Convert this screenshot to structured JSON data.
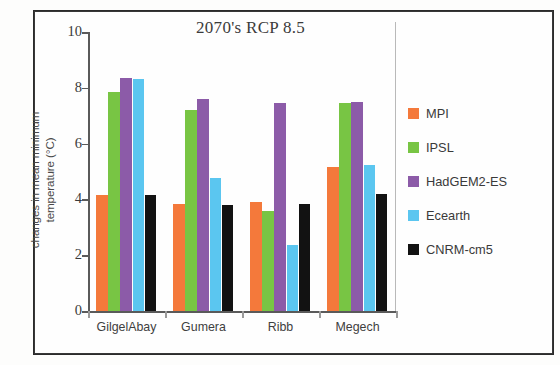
{
  "chart_data": {
    "type": "bar",
    "title": "2070's RCP 8.5",
    "xlabel": "",
    "ylabel": "changes in mean minimum temperature (°C)",
    "ylabel_lines": [
      "changes in mean minimum",
      "temperature (°C)"
    ],
    "ylim": [
      0,
      10
    ],
    "yticks": [
      0,
      2,
      4,
      6,
      8,
      10
    ],
    "ytick_labels": [
      "0",
      "2",
      "4",
      "6",
      "8",
      "10"
    ],
    "grid": false,
    "legend_position": "right",
    "categories": [
      "GilgelAbay",
      "Gumera",
      "Ribb",
      "Megech"
    ],
    "series": [
      {
        "name": "MPI",
        "color": "#F4793B",
        "values": [
          4.15,
          3.85,
          3.9,
          5.15
        ]
      },
      {
        "name": "IPSL",
        "color": "#78C544",
        "values": [
          7.85,
          7.2,
          3.6,
          7.45
        ]
      },
      {
        "name": "HadGEM2-ES",
        "color": "#8C5BA8",
        "values": [
          8.35,
          7.6,
          7.45,
          7.5
        ]
      },
      {
        "name": "Ecearth",
        "color": "#5BC6F0",
        "values": [
          8.3,
          4.75,
          2.35,
          5.25
        ]
      },
      {
        "name": "CNRM-cm5",
        "color": "#121212",
        "values": [
          4.15,
          3.8,
          3.85,
          4.2
        ]
      }
    ]
  },
  "legend": {
    "items": [
      {
        "label": "MPI",
        "color": "#F4793B"
      },
      {
        "label": "IPSL",
        "color": "#78C544"
      },
      {
        "label": "HadGEM2-ES",
        "color": "#8C5BA8"
      },
      {
        "label": "Ecearth",
        "color": "#5BC6F0"
      },
      {
        "label": "CNRM-cm5",
        "color": "#121212"
      }
    ]
  },
  "layout": {
    "plot_left": 88,
    "plot_right": 396,
    "baseline_y": 311,
    "top_y": 32,
    "bar_width": 12.2,
    "group_gap": 22,
    "axis_color": "#5a5a5a"
  }
}
